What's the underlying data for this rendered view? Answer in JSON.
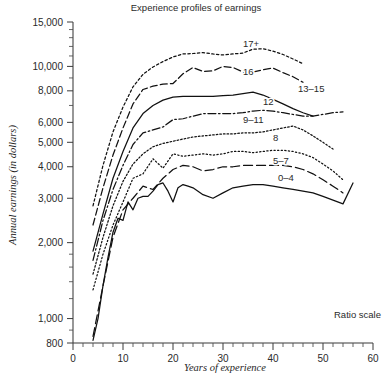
{
  "chart_data": {
    "type": "line",
    "title": "Experience profiles of earnings",
    "xlabel": "Years of experience",
    "ylabel": "Annual earnings (in dollars)",
    "annotation": "Ratio scale",
    "scale": "log",
    "grid": false,
    "legend_position": "inline-labels",
    "xlim": [
      0,
      60
    ],
    "ylim": [
      800,
      15000
    ],
    "xticks": [
      0,
      10,
      20,
      30,
      40,
      50,
      60
    ],
    "xtick_labels": [
      "0",
      "10",
      "20",
      "30",
      "40",
      "50",
      "60"
    ],
    "x_minor_tick_step": 2,
    "yticks": [
      15000,
      10000,
      8000,
      6000,
      5000,
      4000,
      3000,
      2000,
      1000,
      800
    ],
    "ytick_labels": [
      "15,000",
      "10,000",
      "8,000",
      "6,000",
      "5,000",
      "4,000",
      "3,000",
      "2,000",
      "1,000",
      "800"
    ],
    "series": [
      {
        "name": "17+",
        "label": "17+",
        "dash": "dotted",
        "label_x": 34,
        "label_y": 11900,
        "x": [
          4,
          6,
          8,
          10,
          12,
          14,
          16,
          18,
          20,
          22,
          24,
          26,
          28,
          30,
          32,
          34,
          36,
          38,
          40,
          42,
          44,
          46
        ],
        "y": [
          2800,
          4050,
          5500,
          6900,
          8300,
          9300,
          9950,
          10450,
          10900,
          11200,
          11250,
          11350,
          11200,
          11100,
          11200,
          11300,
          11700,
          11750,
          11500,
          11150,
          10700,
          10250
        ]
      },
      {
        "name": "16",
        "label": "16",
        "dash": "dashed",
        "label_x": 34,
        "label_y": 9250,
        "x": [
          4,
          6,
          8,
          10,
          12,
          14,
          16,
          18,
          20,
          22,
          24,
          26,
          28,
          30,
          32,
          34,
          36,
          38,
          40,
          42,
          44,
          46
        ],
        "y": [
          2350,
          3300,
          4450,
          5700,
          7100,
          8100,
          8350,
          8500,
          8550,
          9350,
          9900,
          9550,
          9600,
          10000,
          9900,
          9500,
          9500,
          9700,
          9850,
          9450,
          9100,
          8650
        ]
      },
      {
        "name": "13-15",
        "label": "13–15",
        "dash": "solid",
        "label_x": 45,
        "label_y": 7900,
        "x": [
          4,
          6,
          8,
          10,
          12,
          14,
          16,
          18,
          20,
          22,
          24,
          26,
          28,
          30,
          32,
          34,
          36,
          38,
          40,
          42,
          44,
          46,
          48
        ],
        "y": [
          1850,
          2600,
          3600,
          4600,
          5700,
          6500,
          7000,
          7350,
          7550,
          7600,
          7600,
          7600,
          7600,
          7650,
          7700,
          7800,
          7900,
          7700,
          7400,
          7100,
          6800,
          6550,
          6350
        ]
      },
      {
        "name": "12",
        "label": "12",
        "dash": "dashdot",
        "label_x": 38,
        "label_y": 7000,
        "x": [
          4,
          6,
          8,
          10,
          12,
          14,
          16,
          18,
          20,
          22,
          24,
          26,
          28,
          30,
          32,
          34,
          36,
          38,
          40,
          42,
          44,
          46,
          48,
          50,
          52,
          54
        ],
        "y": [
          1700,
          2450,
          3250,
          4050,
          4900,
          5450,
          5600,
          5750,
          6150,
          6200,
          6350,
          6500,
          6500,
          6500,
          6500,
          6550,
          6650,
          6700,
          6650,
          6550,
          6450,
          6350,
          6350,
          6450,
          6550,
          6600
        ]
      },
      {
        "name": "9-11",
        "label": "9–11",
        "dash": "dotted-dense",
        "label_x": 34,
        "label_y": 5950,
        "x": [
          4,
          6,
          8,
          10,
          12,
          14,
          16,
          18,
          20,
          22,
          24,
          26,
          28,
          30,
          32,
          34,
          36,
          38,
          40,
          42,
          44,
          46,
          48,
          50,
          52
        ],
        "y": [
          1500,
          2100,
          2800,
          3500,
          4100,
          4500,
          4800,
          4950,
          5050,
          5150,
          5250,
          5300,
          5350,
          5400,
          5400,
          5450,
          5450,
          5500,
          5600,
          5700,
          5800,
          5600,
          5300,
          5000,
          4700
        ]
      },
      {
        "name": "8",
        "label": "8",
        "dash": "dotted-fine",
        "label_x": 40,
        "label_y": 5050,
        "x": [
          4,
          6,
          8,
          10,
          12,
          14,
          16,
          18,
          20,
          22,
          24,
          26,
          28,
          30,
          32,
          34,
          36,
          38,
          40,
          42,
          44,
          46,
          48,
          50,
          52,
          54
        ],
        "y": [
          1300,
          1800,
          2350,
          2900,
          3600,
          3750,
          4300,
          3950,
          4500,
          4400,
          4450,
          4500,
          4450,
          4500,
          4600,
          4600,
          4550,
          4600,
          4650,
          4650,
          4600,
          4500,
          4350,
          4100,
          3850,
          3550
        ]
      },
      {
        "name": "5-7",
        "label": "5–7",
        "dash": "long-dash",
        "label_x": 40,
        "label_y": 4100,
        "x": [
          4,
          6,
          8,
          10,
          12,
          14,
          16,
          18,
          20,
          22,
          24,
          26,
          28,
          30,
          32,
          34,
          36,
          38,
          40,
          42,
          44,
          46,
          48,
          50,
          52,
          54
        ],
        "y": [
          850,
          1350,
          2100,
          2700,
          3000,
          3350,
          3250,
          3600,
          3900,
          4050,
          4000,
          3850,
          3900,
          4000,
          4000,
          4050,
          4050,
          4050,
          4050,
          4050,
          4000,
          3900,
          3750,
          3550,
          3350,
          3150
        ]
      },
      {
        "name": "0-4",
        "label": "0–4",
        "dash": "solid",
        "label_x": 41,
        "label_y": 3500,
        "x": [
          4,
          5,
          6,
          7,
          8,
          9,
          10,
          11,
          12,
          13,
          14,
          15,
          16,
          17,
          18,
          19,
          20,
          21,
          22,
          23,
          24,
          26,
          28,
          30,
          32,
          34,
          36,
          38,
          40,
          42,
          44,
          46,
          48,
          50,
          52,
          54,
          56
        ],
        "y": [
          820,
          1000,
          1350,
          1750,
          2200,
          2500,
          2450,
          2900,
          2700,
          3000,
          3050,
          3050,
          3200,
          3400,
          3450,
          3200,
          2900,
          3300,
          3400,
          3350,
          3300,
          3100,
          3000,
          3150,
          3300,
          3350,
          3400,
          3400,
          3350,
          3300,
          3250,
          3200,
          3150,
          3050,
          2950,
          2850,
          3450
        ]
      }
    ]
  }
}
